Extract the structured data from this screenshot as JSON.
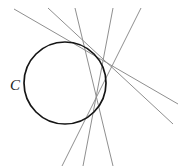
{
  "figure": {
    "background_color": "#ffffff",
    "width": 181,
    "height": 168,
    "labels": [
      {
        "name": "circle-label-c",
        "text": "C",
        "x": 15,
        "y": 90,
        "font_size": 15,
        "color": "#1a1a1a",
        "style": "italic"
      }
    ],
    "circle": {
      "name": "circle-c",
      "cx": 65,
      "cy": 83,
      "r": 41,
      "stroke_color": "#151515",
      "stroke_width": 1.7,
      "fill": "none"
    },
    "lines": {
      "stroke_color": "#8f8f8f",
      "stroke_width": 1.0,
      "count": 5,
      "items": [
        {
          "name": "line-1",
          "x1": 14,
          "y1": 9,
          "x2": 178,
          "y2": 104,
          "description": "shallow descending secant from upper-left to right edge"
        },
        {
          "name": "line-2",
          "x1": 48,
          "y1": 8,
          "x2": 173,
          "y2": 124,
          "description": "descending secant from top to lower-right edge"
        },
        {
          "name": "line-3",
          "x1": 75,
          "y1": 8,
          "x2": 113,
          "y2": 166,
          "description": "steep line from top crossing down to bottom edge"
        },
        {
          "name": "line-4",
          "x1": 113,
          "y1": 8,
          "x2": 83,
          "y2": 166,
          "description": "steep line from top descending left to bottom edge"
        },
        {
          "name": "line-5",
          "x1": 141,
          "y1": 8,
          "x2": 62,
          "y2": 166,
          "description": "steeply leaning line from upper-right to bottom-left"
        }
      ]
    },
    "colors": {
      "line": "#8f8f8f",
      "circle": "#151515",
      "label": "#1a1a1a",
      "background": "#ffffff"
    }
  }
}
